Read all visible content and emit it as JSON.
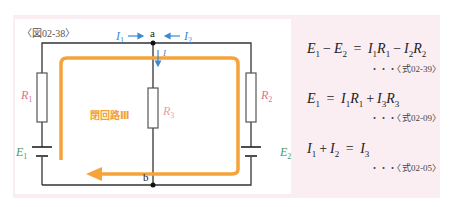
{
  "figure": {
    "label": "〈図02-38〉",
    "loop_label": "閉回路Ⅲ",
    "nodes": {
      "top": "a",
      "bottom": "b"
    },
    "components": {
      "R1": {
        "symbol": "R",
        "sub": "1"
      },
      "R2": {
        "symbol": "R",
        "sub": "2"
      },
      "R3": {
        "symbol": "R",
        "sub": "3"
      },
      "E1": {
        "symbol": "E",
        "sub": "1"
      },
      "E2": {
        "symbol": "E",
        "sub": "2"
      }
    },
    "currents": {
      "I1": {
        "symbol": "I",
        "sub": "1"
      },
      "I2": {
        "symbol": "I",
        "sub": "2"
      },
      "I3": {
        "symbol": "I",
        "sub": ""
      }
    },
    "colors": {
      "panel_bg": "#fbeef2",
      "loop": "#f5a33a",
      "resistor_label": "#d9738a",
      "emf_label": "#4a9a6a",
      "current": "#3a8ad0",
      "wire": "#333333"
    }
  },
  "equations": [
    {
      "lhs": [
        "E",
        "1",
        "−",
        "E",
        "2"
      ],
      "rhs": [
        "I",
        "1",
        "R",
        "1",
        "−",
        "I",
        "2",
        "R",
        "2"
      ],
      "ref": "・・・〈式02-39〉"
    },
    {
      "lhs": [
        "E",
        "1"
      ],
      "rhs": [
        "I",
        "1",
        "R",
        "1",
        "+",
        "I",
        "3",
        "R",
        "3"
      ],
      "ref": "・・・〈式02-09〉"
    },
    {
      "lhs": [
        "I",
        "1",
        "+",
        "I",
        "2"
      ],
      "rhs": [
        "I",
        "3"
      ],
      "ref": "・・・〈式02-05〉"
    }
  ],
  "equals": "="
}
